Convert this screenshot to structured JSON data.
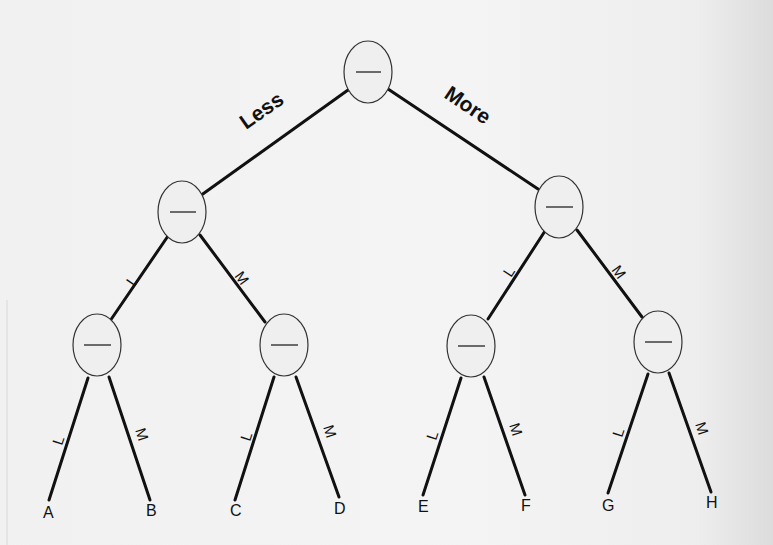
{
  "diagram": {
    "type": "binary-decision-tree",
    "colors": {
      "line": "#111111",
      "node_fill": "#efefef",
      "node_stroke": "#333333",
      "background": "#f2f2f2"
    },
    "root": {
      "id": "root",
      "label": "—",
      "cx": 368,
      "cy": 72
    },
    "top_edges": [
      {
        "id": "edge-less",
        "label": "Less",
        "from": "root",
        "to": "n-left"
      },
      {
        "id": "edge-more",
        "label": "More",
        "from": "root",
        "to": "n-right"
      }
    ],
    "nodes": [
      {
        "id": "root",
        "label": "—",
        "cx": 368,
        "cy": 72
      },
      {
        "id": "n-left",
        "label": "—",
        "cx": 182,
        "cy": 212
      },
      {
        "id": "n-right",
        "label": "—",
        "cx": 559,
        "cy": 207
      },
      {
        "id": "n-LL",
        "label": "—",
        "cx": 97,
        "cy": 345
      },
      {
        "id": "n-LM",
        "label": "—",
        "cx": 284,
        "cy": 345
      },
      {
        "id": "n-RL",
        "label": "—",
        "cx": 471,
        "cy": 346
      },
      {
        "id": "n-RM",
        "label": "—",
        "cx": 658,
        "cy": 342
      }
    ],
    "branch_labels": {
      "left": "L",
      "right": "M"
    },
    "leaves": [
      {
        "id": "A",
        "label": "A"
      },
      {
        "id": "B",
        "label": "B"
      },
      {
        "id": "C",
        "label": "C"
      },
      {
        "id": "D",
        "label": "D"
      },
      {
        "id": "E",
        "label": "E"
      },
      {
        "id": "F",
        "label": "F"
      },
      {
        "id": "G",
        "label": "G"
      },
      {
        "id": "H",
        "label": "H"
      }
    ]
  }
}
